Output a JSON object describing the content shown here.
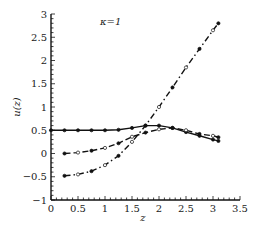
{
  "chart_data": {
    "type": "line",
    "title": "",
    "annotation": "κ=1",
    "xlabel": "z",
    "ylabel": "u(z)",
    "xlim": [
      0,
      3.5
    ],
    "ylim": [
      -1,
      3
    ],
    "xticks": [
      "0",
      "0.5",
      "1",
      "1.5",
      "2",
      "2.5",
      "3",
      "3.5"
    ],
    "yticks": [
      "−1",
      "−0.5",
      "0",
      "0.5",
      "1",
      "1.5",
      "2",
      "2.5",
      "3"
    ],
    "grid": false,
    "legend": null,
    "series": [
      {
        "name": "solid",
        "style": "solid",
        "x": [
          0,
          0.25,
          0.5,
          0.75,
          1.0,
          1.25,
          1.5,
          1.75,
          2.0,
          2.25,
          2.5,
          2.75,
          3.0,
          3.1
        ],
        "y": [
          0.5,
          0.5,
          0.5,
          0.5,
          0.5,
          0.51,
          0.55,
          0.6,
          0.6,
          0.55,
          0.46,
          0.38,
          0.3,
          0.27
        ]
      },
      {
        "name": "dashed",
        "style": "dashed",
        "x": [
          0.25,
          0.5,
          0.75,
          1.0,
          1.25,
          1.5,
          1.75,
          2.0,
          2.25,
          2.5,
          2.75,
          3.0,
          3.1
        ],
        "y": [
          0.0,
          0.02,
          0.06,
          0.12,
          0.22,
          0.36,
          0.45,
          0.52,
          0.55,
          0.5,
          0.42,
          0.38,
          0.35
        ]
      },
      {
        "name": "dash-dot",
        "style": "dashdot",
        "x": [
          0.25,
          0.5,
          0.75,
          1.0,
          1.25,
          1.5,
          1.75,
          2.0,
          2.25,
          2.5,
          2.75,
          3.0,
          3.1
        ],
        "y": [
          -0.48,
          -0.45,
          -0.38,
          -0.25,
          -0.05,
          0.25,
          0.6,
          1.0,
          1.42,
          1.85,
          2.25,
          2.65,
          2.8
        ]
      }
    ]
  }
}
